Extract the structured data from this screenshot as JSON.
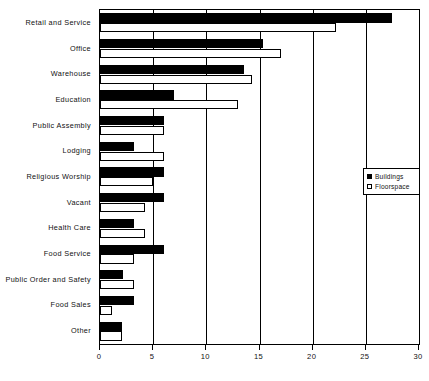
{
  "chart_data": {
    "type": "bar",
    "orientation": "horizontal",
    "title": "",
    "xlabel": "",
    "ylabel": "",
    "xlim": [
      0,
      30
    ],
    "xticks": [
      0,
      5,
      10,
      15,
      20,
      25,
      30
    ],
    "grid": true,
    "grid_axis": "x",
    "legend_position": "right-middle",
    "categories": [
      "Retail and Service",
      "Office",
      "Warehouse",
      "Education",
      "Public Assembly",
      "Lodging",
      "Religious Worship",
      "Vacant",
      "Health Care",
      "Food Service",
      "Public Order and Safety",
      "Food Sales",
      "Other"
    ],
    "series": [
      {
        "name": "Buildings",
        "style": "filled-black",
        "color": "#000000",
        "values": [
          27.5,
          15.3,
          13.5,
          7.0,
          6.0,
          3.2,
          6.0,
          6.0,
          3.2,
          6.0,
          2.2,
          3.2,
          2.1
        ]
      },
      {
        "name": "Floorspace",
        "style": "hollow-white",
        "color": "#ffffff",
        "values": [
          22.2,
          17.0,
          14.3,
          13.0,
          6.0,
          6.0,
          5.0,
          4.2,
          4.2,
          3.2,
          3.2,
          1.1,
          2.1
        ]
      }
    ]
  },
  "legend": {
    "entries": [
      {
        "label": "Buildings",
        "swatch": "filled"
      },
      {
        "label": "Floorspace",
        "swatch": "hollow"
      }
    ]
  }
}
